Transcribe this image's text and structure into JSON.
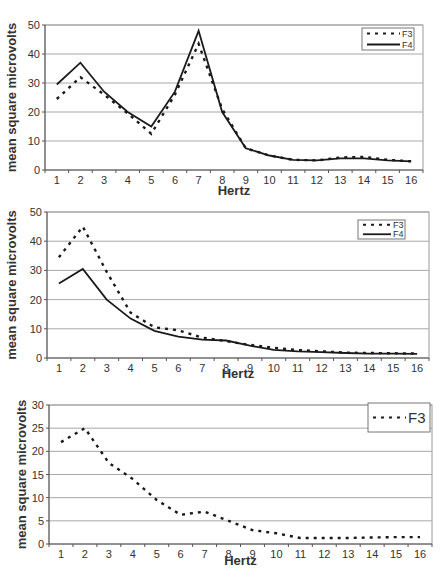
{
  "chart_data": [
    {
      "type": "line",
      "title": "",
      "xlabel": "Hertz",
      "ylabel": "mean square microvolts",
      "categories": [
        "1",
        "2",
        "3",
        "4",
        "5",
        "6",
        "7",
        "8",
        "9",
        "10",
        "11",
        "12",
        "13",
        "14",
        "15",
        "16"
      ],
      "ylim": [
        0,
        50
      ],
      "yticks": [
        0,
        10,
        20,
        30,
        40,
        50
      ],
      "grid": true,
      "legend_position": "top-right",
      "series": [
        {
          "name": "F3",
          "style": "dashed",
          "values": [
            24.5,
            32,
            26,
            19.5,
            12.5,
            26,
            43.5,
            21,
            7.5,
            5,
            3.5,
            3.3,
            4.3,
            4.5,
            3.5,
            3
          ]
        },
        {
          "name": "F4",
          "style": "solid",
          "values": [
            29.5,
            37,
            27,
            20,
            15,
            27,
            48,
            20,
            7.5,
            5,
            3.5,
            3.3,
            4,
            4,
            3.3,
            3
          ]
        }
      ]
    },
    {
      "type": "line",
      "title": "",
      "xlabel": "Hertz",
      "ylabel": "mean square microvolts",
      "categories": [
        "1",
        "2",
        "3",
        "4",
        "5",
        "6",
        "7",
        "8",
        "9",
        "10",
        "11",
        "12",
        "13",
        "14",
        "15",
        "16"
      ],
      "ylim": [
        0,
        50
      ],
      "yticks": [
        0,
        10,
        20,
        30,
        40,
        50
      ],
      "grid": true,
      "legend_position": "top-right",
      "series": [
        {
          "name": "F3",
          "style": "dashed",
          "values": [
            34.5,
            45,
            29.5,
            15.5,
            10.5,
            9.5,
            7,
            5.8,
            4.5,
            3.5,
            2.7,
            2.3,
            1.8,
            1.7,
            1.6,
            1.5
          ]
        },
        {
          "name": "F4",
          "style": "solid",
          "values": [
            25.5,
            30.5,
            20,
            13.5,
            9.3,
            7.3,
            6.3,
            6,
            4.2,
            2.8,
            2.3,
            2,
            1.7,
            1.5,
            1.5,
            1.4
          ]
        }
      ]
    },
    {
      "type": "line",
      "title": "",
      "xlabel": "Hertz",
      "ylabel": "mean square microvolts",
      "categories": [
        "1",
        "2",
        "3",
        "4",
        "5",
        "6",
        "7",
        "8",
        "9",
        "10",
        "11",
        "12",
        "13",
        "14",
        "15",
        "16"
      ],
      "ylim": [
        0,
        30
      ],
      "yticks": [
        0,
        5,
        10,
        15,
        20,
        25,
        30
      ],
      "grid": true,
      "legend_position": "top-right",
      "series": [
        {
          "name": "F3",
          "style": "dashed",
          "values": [
            22,
            25,
            17.5,
            14,
            9.5,
            6.3,
            7,
            5,
            3,
            2.3,
            1.3,
            1.3,
            1.3,
            1.4,
            1.5,
            1.5
          ]
        }
      ]
    }
  ],
  "charts": [
    {
      "xlabel": "Hertz",
      "ylabel": "mean square microvolts",
      "legend": [
        "F3",
        "F4"
      ]
    },
    {
      "xlabel": "Hertz",
      "ylabel": "mean square microvolts",
      "legend": [
        "F3",
        "F4"
      ]
    },
    {
      "xlabel": "Hertz",
      "ylabel": "mean square microvolts",
      "legend": [
        "F3"
      ]
    }
  ]
}
